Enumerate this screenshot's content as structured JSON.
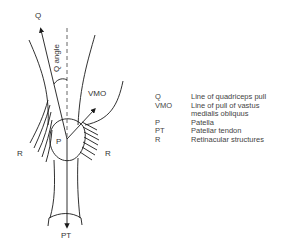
{
  "figure": {
    "labels": {
      "q": "Q",
      "q_angle": "Q angle",
      "vmo": "VMO",
      "p": "P",
      "r_left": "R",
      "r_right": "R",
      "pt": "PT"
    }
  },
  "legend": {
    "items": [
      {
        "abbr": "Q",
        "desc": "Line of quadriceps pull"
      },
      {
        "abbr": "VMO",
        "desc": "Line of pull of vastus"
      },
      {
        "abbr": "",
        "desc": "medialis obliquus"
      },
      {
        "abbr": "P",
        "desc": "Patella"
      },
      {
        "abbr": "PT",
        "desc": "Patellar tendon"
      },
      {
        "abbr": "R",
        "desc": "Retinacular structures"
      }
    ]
  },
  "colors": {
    "line": "#1a1a1a",
    "text": "#333333",
    "background": "#ffffff"
  }
}
